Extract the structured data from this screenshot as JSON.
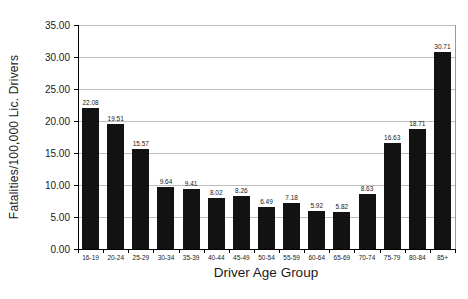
{
  "figure": {
    "background_color": "#ffffff",
    "bar_color": "#121212",
    "gridline_color": "#bdbdbd",
    "axis_color": "#000000",
    "text_color": "#1a1a1a"
  },
  "chart_data": {
    "type": "bar",
    "title": "",
    "xlabel": "Driver Age Group",
    "ylabel": "Fatalities/100,000 Lic. Drivers",
    "categories": [
      "16-19",
      "20-24",
      "25-29",
      "30-34",
      "35-39",
      "40-44",
      "45-49",
      "50-54",
      "55-59",
      "60-64",
      "65-69",
      "70-74",
      "75-79",
      "80-84",
      "85+"
    ],
    "values": [
      22.08,
      19.51,
      15.57,
      9.64,
      9.41,
      8.02,
      8.26,
      6.49,
      7.18,
      5.92,
      5.82,
      8.63,
      16.63,
      18.71,
      30.71
    ],
    "value_labels": [
      "22.08",
      "19.51",
      "15.57",
      "9.64",
      "9.41",
      "8.02",
      "8.26",
      "6.49",
      "7.18",
      "5.92",
      "5.82",
      "8.63",
      "16.63",
      "18.71",
      "30.71"
    ],
    "ylim": [
      0,
      35
    ],
    "ytick_step": 5,
    "ytick_labels": [
      "0.00",
      "5.00",
      "10.00",
      "15.00",
      "20.00",
      "25.00",
      "30.00",
      "35.00"
    ],
    "grid": true,
    "legend_position": "none"
  }
}
